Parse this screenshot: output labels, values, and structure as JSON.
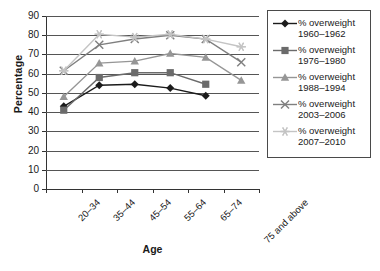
{
  "chart_data": {
    "type": "line",
    "title": "",
    "xlabel": "Age",
    "ylabel": "Percentage",
    "ylim": [
      0,
      90
    ],
    "ytick_step": 10,
    "yticks": [
      0,
      10,
      20,
      30,
      40,
      50,
      60,
      70,
      80,
      90
    ],
    "grid": true,
    "legend_position": "right",
    "categories": [
      "20–34",
      "35–44",
      "45–54",
      "55–64",
      "65–74",
      "75 and above"
    ],
    "series": [
      {
        "name": "% overweight 1960–1962",
        "label_line1": "% overweight",
        "label_line2": "1960–1962",
        "marker": "diamond",
        "color": "#1b1b1b",
        "values": [
          43,
          54,
          54.5,
          52.5,
          48.5,
          null
        ]
      },
      {
        "name": "% overweight 1976–1980",
        "label_line1": "% overweight",
        "label_line2": "1976–1980",
        "marker": "square",
        "color": "#6b6b6b",
        "values": [
          41,
          58,
          60.5,
          60.5,
          54.5,
          null
        ]
      },
      {
        "name": "% overweight 1988–1994",
        "label_line1": "% overweight",
        "label_line2": "1988–1994",
        "marker": "triangle",
        "color": "#969696",
        "values": [
          48,
          65.5,
          66.5,
          70.5,
          68.5,
          56.5
        ]
      },
      {
        "name": "% overweight 2003–2006",
        "label_line1": "% overweight",
        "label_line2": "2003–2006",
        "marker": "x",
        "color": "#7f7f7f",
        "values": [
          61.5,
          75,
          78,
          80,
          78,
          66
        ]
      },
      {
        "name": "% overweight 2007–2010",
        "label_line1": "% overweight",
        "label_line2": "2007–2010",
        "marker": "star",
        "color": "#c4c4c4",
        "values": [
          61.5,
          80.5,
          79,
          80.5,
          78,
          74
        ]
      }
    ]
  },
  "axis": {
    "y_title": "Percentage",
    "x_title": "Age"
  }
}
